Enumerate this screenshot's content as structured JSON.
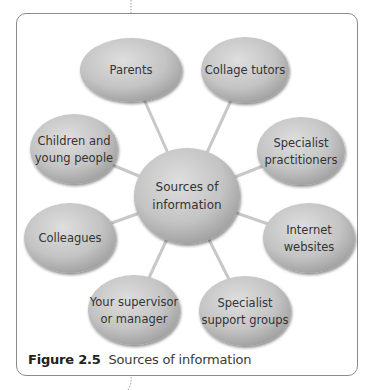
{
  "diagram": {
    "type": "spider-diagram",
    "center": {
      "id": "center",
      "lines": [
        "Sources of",
        "information"
      ]
    },
    "nodes": [
      {
        "id": "parents",
        "lines": [
          "Parents"
        ]
      },
      {
        "id": "collage-tutors",
        "lines": [
          "Collage tutors"
        ]
      },
      {
        "id": "children-young-people",
        "lines": [
          "Children and",
          "young people"
        ]
      },
      {
        "id": "specialist-practitioners",
        "lines": [
          "Specialist",
          "practitioners"
        ]
      },
      {
        "id": "colleagues",
        "lines": [
          "Colleagues"
        ]
      },
      {
        "id": "internet-websites",
        "lines": [
          "Internet",
          "websites"
        ]
      },
      {
        "id": "supervisor-manager",
        "lines": [
          "Your supervisor",
          "or manager"
        ]
      },
      {
        "id": "specialist-support-groups",
        "lines": [
          "Specialist",
          "support groups"
        ]
      }
    ],
    "colors": {
      "ellipse_light": "#d9d9d9",
      "ellipse_mid": "#bdbdbd",
      "ellipse_dark": "#9a9a9a",
      "connector": "#c8c8c8",
      "frame": "#8c8c8c"
    }
  },
  "caption": {
    "figure_label": "Figure 2.5",
    "text": "Sources of information"
  }
}
